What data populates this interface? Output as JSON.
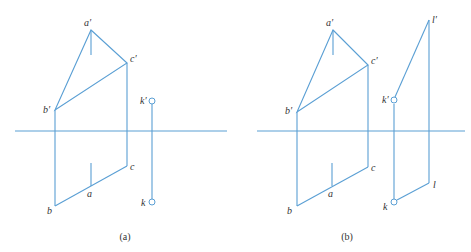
{
  "colors": {
    "line": "#5a9fd4",
    "text": "#333333",
    "background": "#ffffff"
  },
  "panel_a": {
    "caption": "(a)",
    "labels": {
      "a_prime": "a′",
      "b_prime": "b′",
      "c_prime": "c′",
      "k_prime": "k′",
      "a": "a",
      "b": "b",
      "c": "c",
      "k": "k"
    }
  },
  "panel_b": {
    "caption": "(b)",
    "labels": {
      "a_prime": "a′",
      "b_prime": "b′",
      "c_prime": "c′",
      "k_prime": "k′",
      "l_prime": "l′",
      "a": "a",
      "b": "b",
      "c": "c",
      "k": "k",
      "l": "l"
    }
  }
}
